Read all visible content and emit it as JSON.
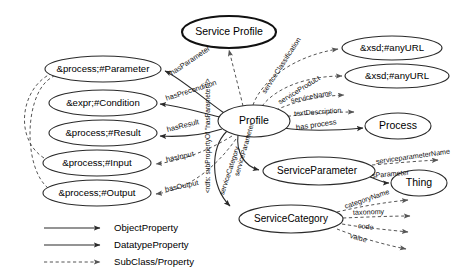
{
  "diagram": {
    "colors": {
      "node_stroke": "#2a2a2a",
      "bold_node_stroke": "#111111",
      "solid_edge": "#2a2a2a",
      "dashed_edge": "#555555",
      "background": "#ffffff",
      "text": "#000000"
    },
    "nodes": [
      {
        "id": "service-profile",
        "label": "Service Profile",
        "cx": 229,
        "cy": 32,
        "rx": 47,
        "ry": 16,
        "emphasis": "bold",
        "font_size": 10.5
      },
      {
        "id": "profile",
        "label": "Profile",
        "cx": 254,
        "cy": 121,
        "rx": 36,
        "ry": 16,
        "emphasis": "normal",
        "font_size": 10.5
      },
      {
        "id": "process-parameter",
        "label": "&process;#Parameter",
        "cx": 103,
        "cy": 69,
        "rx": 58,
        "ry": 13,
        "emphasis": "normal",
        "font_size": 9.5
      },
      {
        "id": "expr-condition",
        "label": "&expr;#Condition",
        "cx": 103,
        "cy": 103,
        "rx": 54,
        "ry": 13,
        "emphasis": "normal",
        "font_size": 9.5
      },
      {
        "id": "process-result",
        "label": "&process;#Result",
        "cx": 103,
        "cy": 133,
        "rx": 54,
        "ry": 13,
        "emphasis": "normal",
        "font_size": 9.5
      },
      {
        "id": "process-input",
        "label": "&process;#Input",
        "cx": 97,
        "cy": 163,
        "rx": 54,
        "ry": 13,
        "emphasis": "normal",
        "font_size": 9.5
      },
      {
        "id": "process-output",
        "label": "&process;#Output",
        "cx": 97,
        "cy": 193,
        "rx": 54,
        "ry": 13,
        "emphasis": "normal",
        "font_size": 9.5
      },
      {
        "id": "xsd-anyurl-1",
        "label": "&xsd;#anyURL",
        "cx": 392,
        "cy": 48,
        "rx": 50,
        "ry": 12,
        "emphasis": "normal",
        "font_size": 9.5
      },
      {
        "id": "xsd-anyurl-2",
        "label": "&xsd;#anyURL",
        "cx": 397,
        "cy": 76,
        "rx": 52,
        "ry": 12,
        "emphasis": "normal",
        "font_size": 9.5
      },
      {
        "id": "process",
        "label": "Process",
        "cx": 398,
        "cy": 126,
        "rx": 33,
        "ry": 13,
        "emphasis": "normal",
        "font_size": 10.5
      },
      {
        "id": "service-parameter",
        "label": "ServiceParameter",
        "cx": 319,
        "cy": 171,
        "rx": 56,
        "ry": 14,
        "emphasis": "normal",
        "font_size": 10
      },
      {
        "id": "thing",
        "label": "Thing",
        "cx": 419,
        "cy": 183,
        "rx": 28,
        "ry": 13,
        "emphasis": "normal",
        "font_size": 10.5
      },
      {
        "id": "service-category",
        "label": "ServiceCategory",
        "cx": 291,
        "cy": 219,
        "rx": 52,
        "ry": 14,
        "emphasis": "normal",
        "font_size": 10
      }
    ],
    "edges": [
      {
        "id": "profile-subclassof-service-profile",
        "label": "",
        "style": "dashed"
      },
      {
        "id": "has-parameter",
        "label": "hasParameter",
        "style": "solid",
        "from": "profile",
        "to": "process-parameter"
      },
      {
        "id": "has-precondition",
        "label": "hasPrecondition",
        "style": "solid",
        "from": "profile",
        "to": "expr-condition"
      },
      {
        "id": "has-result",
        "label": "hasResult",
        "style": "solid",
        "from": "profile",
        "to": "process-result"
      },
      {
        "id": "has-input",
        "label": "hasInput",
        "style": "dashed",
        "from": "profile",
        "to": "process-input"
      },
      {
        "id": "has-output",
        "label": "hasOutput",
        "style": "dashed",
        "from": "profile",
        "to": "process-output"
      },
      {
        "id": "input-subclass-parameter",
        "label": "",
        "style": "dashed",
        "from": "process-input",
        "to": "process-parameter"
      },
      {
        "id": "output-subclass-parameter",
        "label": "",
        "style": "dashed",
        "from": "process-output",
        "to": "process-parameter"
      },
      {
        "id": "service-classification",
        "label": "serviceClassification",
        "style": "dashed",
        "from": "profile",
        "to": "xsd-anyurl-1"
      },
      {
        "id": "service-product",
        "label": "serviceProduct",
        "style": "dashed",
        "from": "profile",
        "to": "xsd-anyurl-2"
      },
      {
        "id": "service-name",
        "label": "serviceName",
        "style": "dashed",
        "from": "profile",
        "to": ""
      },
      {
        "id": "text-description",
        "label": "textDescription",
        "style": "dashed",
        "from": "profile",
        "to": ""
      },
      {
        "id": "has-process",
        "label": "has process",
        "style": "solid",
        "from": "profile",
        "to": "process"
      },
      {
        "id": "service-parameter-edge",
        "label": "serviceParameter",
        "style": "solid",
        "from": "profile",
        "to": "service-parameter"
      },
      {
        "id": "service-category-edge",
        "label": "serviceCategory",
        "style": "solid",
        "from": "profile",
        "to": "service-category"
      },
      {
        "id": "rdfs-subpropertyof",
        "label": "<rdfs: subPropertyOf \"hasParameter\"/>",
        "style": "annotation"
      },
      {
        "id": "service-parameter-name",
        "label": "serviceparameterName",
        "style": "dashed",
        "from": "service-parameter",
        "to": ""
      },
      {
        "id": "s-parameter",
        "label": "sParameter",
        "style": "solid",
        "from": "service-parameter",
        "to": "thing"
      },
      {
        "id": "category-name",
        "label": "categoryName",
        "style": "dashed",
        "from": "service-category",
        "to": ""
      },
      {
        "id": "taxonomy",
        "label": "taxonomy",
        "style": "dashed",
        "from": "service-category",
        "to": ""
      },
      {
        "id": "code",
        "label": "code",
        "style": "dashed",
        "from": "service-category",
        "to": ""
      },
      {
        "id": "value",
        "label": "value",
        "style": "dashed",
        "from": "service-category",
        "to": ""
      }
    ],
    "legend": [
      {
        "id": "object-property",
        "label": "ObjectProperty",
        "style": "solid"
      },
      {
        "id": "datatype-property",
        "label": "DatatypeProperty",
        "style": "solid"
      },
      {
        "id": "subclass-property",
        "label": "SubClass/Property",
        "style": "dashed"
      }
    ]
  }
}
